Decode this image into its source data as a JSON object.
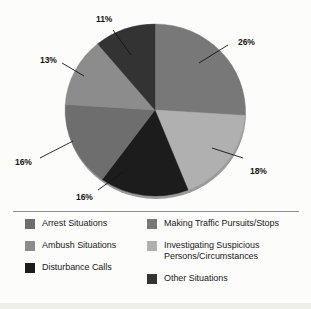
{
  "chart_data": {
    "type": "pie",
    "title": "",
    "subtitle": "",
    "xlabel": "",
    "ylabel": "",
    "legend_position": "bottom",
    "grid": false,
    "unit": "%",
    "start_angle_deg": 0,
    "direction": "clockwise",
    "categories": [
      "Making Traffic Pursuits/Stops",
      "Investigating Suspicious Persons/Circumstances",
      "Disturbance Calls",
      "Arrest Situations",
      "Ambush Situations",
      "Other Situations"
    ],
    "values": [
      26,
      18,
      16,
      16,
      13,
      11
    ],
    "slices": [
      {
        "label": "Making Traffic Pursuits/Stops",
        "value": 26,
        "display": "26%",
        "color": "#787878",
        "start_deg": 0,
        "end_deg": 93.6
      },
      {
        "label": "Investigating Suspicious Persons/Circumstances",
        "value": 18,
        "display": "18%",
        "color": "#b0b0b0",
        "start_deg": 93.6,
        "end_deg": 158.4
      },
      {
        "label": "Disturbance Calls",
        "value": 16,
        "display": "16%",
        "color": "#1c1c1c",
        "start_deg": 158.4,
        "end_deg": 216.0
      },
      {
        "label": "Arrest Situations",
        "value": 16,
        "display": "16%",
        "color": "#6e6e6e",
        "start_deg": 216.0,
        "end_deg": 273.6
      },
      {
        "label": "Ambush Situations",
        "value": 13,
        "display": "13%",
        "color": "#8c8c8c",
        "start_deg": 273.6,
        "end_deg": 320.4
      },
      {
        "label": "Other Situations",
        "value": 11,
        "display": "11%",
        "color": "#333333",
        "start_deg": 320.4,
        "end_deg": 360.0
      }
    ],
    "callout_labels": [
      {
        "text": "11%",
        "x": 96,
        "y": 14
      },
      {
        "text": "26%",
        "x": 238,
        "y": 37
      },
      {
        "text": "13%",
        "x": 40,
        "y": 55
      },
      {
        "text": "18%",
        "x": 250,
        "y": 166
      },
      {
        "text": "16%",
        "x": 15,
        "y": 157
      },
      {
        "text": "16%",
        "x": 76,
        "y": 192
      }
    ]
  },
  "legend": {
    "left_column": [
      {
        "label": "Arrest Situations",
        "color": "#6e6e6e",
        "swatch_name": "legend-swatch-arrest-situations"
      },
      {
        "label": "Ambush Situations",
        "color": "#8c8c8c",
        "swatch_name": "legend-swatch-ambush-situations"
      },
      {
        "label": "Disturbance Calls",
        "color": "#1c1c1c",
        "swatch_name": "legend-swatch-disturbance-calls"
      }
    ],
    "right_column": [
      {
        "label": "Making Traffic Pursuits/Stops",
        "color": "#787878",
        "swatch_name": "legend-swatch-making-traffic-pursuits-stops"
      },
      {
        "label": "Investigating Suspicious Persons/Circumstances",
        "color": "#b0b0b0",
        "swatch_name": "legend-swatch-investigating-suspicious"
      },
      {
        "label": "Other Situations",
        "color": "#333333",
        "swatch_name": "legend-swatch-other-situations"
      }
    ]
  },
  "colors": {
    "background": "#fcfcfa",
    "divider": "#8e8e8e",
    "label_text": "#141414",
    "pie_shadow": "#9a9a9a"
  }
}
